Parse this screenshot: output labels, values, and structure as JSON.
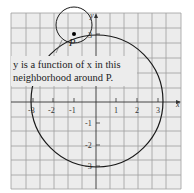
{
  "figure": {
    "caption_line1": "y is a function of x in this",
    "caption_line2": "neighborhood around P.",
    "point_label": "P",
    "x_axis_label": "x",
    "y_axis_label": "y",
    "x_ticks": [
      "-3",
      "-2",
      "-1",
      "1",
      "2",
      "3"
    ],
    "y_ticks": [
      "3",
      "-1",
      "-2",
      "-3"
    ],
    "colors": {
      "grid_bg": "#ececec",
      "grid_line": "#9a9a9a",
      "curve": "#1a1a1a"
    }
  }
}
